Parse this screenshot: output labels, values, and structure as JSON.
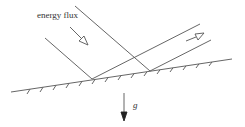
{
  "diagram": {
    "type": "wave reflection from sloping bottom",
    "labels": {
      "energy_flux": "energy flux",
      "gravity": "g"
    },
    "colors": {
      "line": "#555555",
      "background": "#ffffff"
    }
  }
}
